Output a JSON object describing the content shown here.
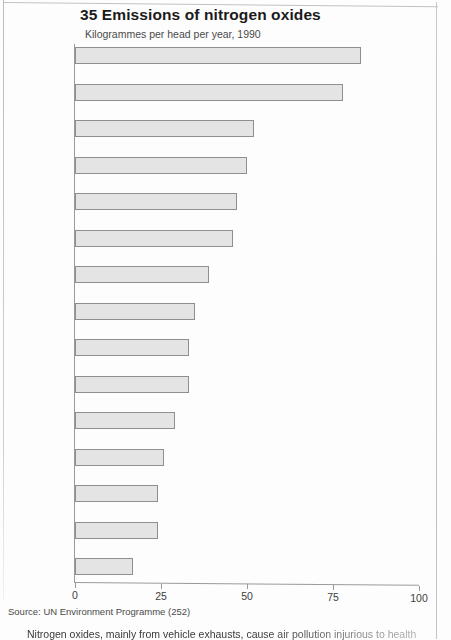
{
  "page": {
    "source_note": "Source: UN Environment Programme (252)",
    "body_caption": "Nitrogen oxides, mainly from vehicle exhausts, cause air pollution injurious to health"
  },
  "chart_data": {
    "type": "bar",
    "orientation": "horizontal",
    "title": "35 Emissions of nitrogen oxides",
    "subtitle": "Kilogrammes per head per year, 1990",
    "xlabel": "",
    "ylabel": "",
    "xlim": [
      0,
      100
    ],
    "xticks": [
      0,
      25,
      50,
      75,
      100
    ],
    "xtick_labels": [
      "0",
      "25",
      "50",
      "75",
      "100"
    ],
    "grid": false,
    "legend": false,
    "highlight_category": "Britain",
    "bar_fill": "#e4e4e4",
    "bar_stroke": "#8f8f8f",
    "categories": [
      "United States",
      "Greece",
      "Denmark",
      "Britain",
      "West Germany",
      "East Germany",
      "Netherlands",
      "Poland",
      "Italy",
      "France",
      "Switzerland",
      "Spain",
      "USSR",
      "Sweden",
      "Japan"
    ],
    "values": [
      83,
      78,
      52,
      50,
      47,
      46,
      39,
      35,
      33,
      33,
      29,
      26,
      24,
      24,
      17
    ]
  }
}
